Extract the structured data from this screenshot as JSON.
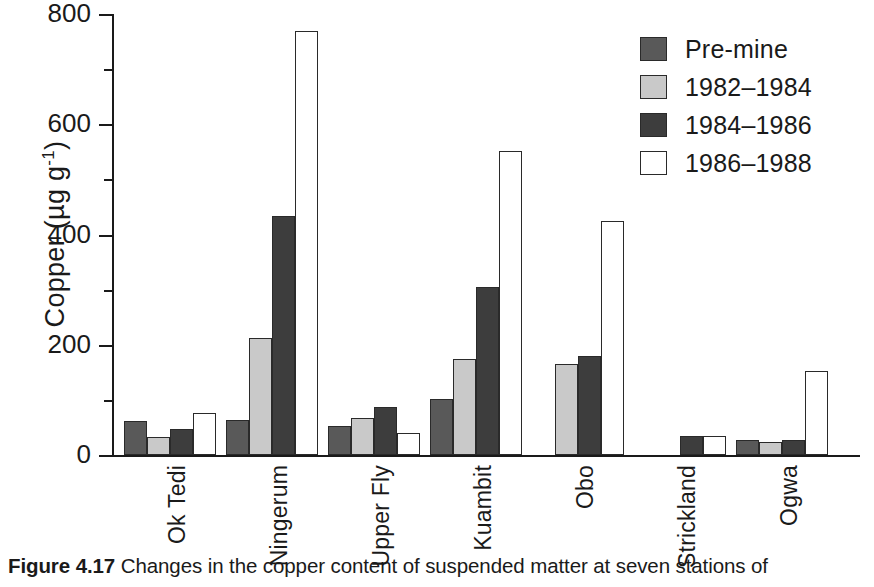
{
  "figure": {
    "caption_label": "Figure 4.17",
    "caption_text": "Changes in the copper content of suspended matter at seven stations of"
  },
  "axis": {
    "y_label_main": "Copper",
    "y_label_units_pre": "  (µg g",
    "y_label_units_sup": "-1",
    "y_label_units_post": ")",
    "y_ticks": [
      "0",
      "200",
      "400",
      "600",
      "800"
    ]
  },
  "legend": {
    "items": [
      {
        "label": "Pre-mine",
        "color": "#595959"
      },
      {
        "label": "1982–1984",
        "color": "#c9c9c9"
      },
      {
        "label": "1984–1986",
        "color": "#3d3d3d"
      },
      {
        "label": "1986–1988",
        "color": "#ffffff"
      }
    ]
  },
  "chart_data": {
    "type": "bar",
    "title": "",
    "xlabel": "",
    "ylabel": "Copper (µg g-1)",
    "ylim": [
      0,
      800
    ],
    "ytick_step": 200,
    "minor_tick_step": 100,
    "grid": false,
    "legend_position": "top-right",
    "categories": [
      "Ok Tedi",
      "Ningerum",
      "Upper Fly",
      "Kuambit",
      "Obo",
      "Strickland",
      "Ogwa"
    ],
    "series": [
      {
        "name": "Pre-mine",
        "color": "#595959",
        "values": [
          62,
          63,
          52,
          102,
          null,
          null,
          27
        ]
      },
      {
        "name": "1982–1984",
        "color": "#c9c9c9",
        "values": [
          32,
          213,
          68,
          175,
          166,
          null,
          23
        ]
      },
      {
        "name": "1984–1986",
        "color": "#3d3d3d",
        "values": [
          47,
          433,
          87,
          305,
          179,
          35,
          27
        ]
      },
      {
        "name": "1986–1988",
        "color": "#ffffff",
        "values": [
          77,
          769,
          40,
          551,
          425,
          34,
          153
        ]
      }
    ]
  }
}
